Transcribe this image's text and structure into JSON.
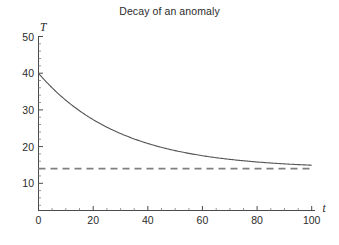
{
  "chart_data": {
    "type": "line",
    "title": "Decay of an anomaly",
    "xlabel": "t",
    "ylabel": "T",
    "xlim": [
      0,
      104
    ],
    "ylim": [
      0,
      52
    ],
    "grid": false,
    "legend_position": "none",
    "xticks": [
      0,
      20,
      40,
      60,
      80,
      100
    ],
    "xtick_labels": [
      "0",
      "20",
      "40",
      "60",
      "80",
      "100"
    ],
    "yticks": [
      10,
      20,
      30,
      40,
      50
    ],
    "ytick_labels": [
      "10",
      "20",
      "30",
      "40",
      "50"
    ],
    "x_minor_tick_step": 5,
    "y_minor_tick_step": 2,
    "series": [
      {
        "name": "temperature-decay-curve",
        "style": "solid",
        "color": "#555555",
        "formula": "T = 14 + 26*exp(-t/30)",
        "x": [
          0,
          5,
          10,
          15,
          20,
          25,
          30,
          35,
          40,
          45,
          50,
          55,
          60,
          65,
          70,
          75,
          80,
          85,
          90,
          95,
          100
        ],
        "values": [
          40.0,
          36.0,
          32.6,
          29.8,
          27.4,
          25.3,
          23.6,
          22.1,
          20.8,
          19.8,
          18.9,
          18.1,
          17.5,
          16.9,
          16.4,
          16.0,
          15.7,
          15.4,
          15.2,
          15.0,
          14.9
        ]
      },
      {
        "name": "asymptote-line",
        "style": "dashed",
        "color": "#808080",
        "constant_value": 14,
        "x": [
          0,
          100
        ],
        "values": [
          14,
          14
        ]
      }
    ]
  },
  "axes": {
    "x_axis_label": "t",
    "y_axis_label": "T"
  }
}
